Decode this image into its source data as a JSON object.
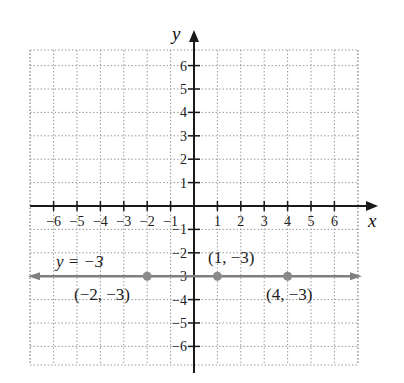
{
  "chart_data": {
    "type": "line",
    "title": "",
    "xlabel": "x",
    "ylabel": "y",
    "xlim": [
      -6.5,
      7
    ],
    "ylim": [
      -6.8,
      7
    ],
    "grid": true,
    "x_ticks": [
      "-6",
      "-5",
      "-4",
      "-3",
      "-2",
      "-1",
      "1",
      "2",
      "3",
      "4",
      "5",
      "6"
    ],
    "y_ticks": [
      "6",
      "5",
      "4",
      "3",
      "2",
      "1",
      "-1",
      "-2",
      "-3",
      "-4",
      "-5",
      "-6"
    ],
    "series": [
      {
        "name": "y = -3",
        "type": "horizontal-line",
        "y": -3,
        "color": "#808080"
      }
    ],
    "points": [
      {
        "x": -2,
        "y": -3,
        "label": "(−2, −3)"
      },
      {
        "x": 1,
        "y": -3,
        "label": "(1, −3)"
      },
      {
        "x": 4,
        "y": -3,
        "label": "(4, −3)"
      }
    ],
    "annotations": [
      {
        "text": "y = −3",
        "near": {
          "x": -4.5,
          "y": -2.5
        }
      }
    ]
  },
  "labels": {
    "x_axis": "x",
    "y_axis": "y",
    "equation": "y = −3",
    "p1": "(−2, −3)",
    "p2": "(1, −3)",
    "p3": "(4, −3)"
  },
  "colors": {
    "axis": "#1a1a1a",
    "grid": "#9a9a9a",
    "line": "#7f7f7f",
    "point": "#8a8a8a"
  }
}
